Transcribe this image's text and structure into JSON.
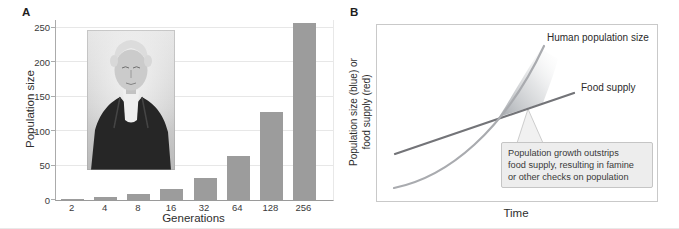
{
  "figure": {
    "panel_a_label": "A",
    "panel_b_label": "B",
    "portrait": "thomas-malthus-engraving"
  },
  "chart_data": [
    {
      "type": "bar",
      "panel": "A",
      "categories": [
        "2",
        "4",
        "8",
        "16",
        "32",
        "64",
        "128",
        "256"
      ],
      "values": [
        2,
        4,
        8,
        16,
        32,
        64,
        128,
        256
      ],
      "xlabel": "Generations",
      "ylabel": "Population size",
      "y_ticks": [
        0,
        50,
        100,
        150,
        200,
        250
      ],
      "ylim": [
        0,
        260
      ],
      "grid": true,
      "bar_color": "#9c9c9c"
    },
    {
      "type": "line",
      "panel": "B",
      "xlabel": "Time",
      "ylabel_lines": [
        "Population size (blue) or",
        "food supply (red)"
      ],
      "axis_ticks": "none",
      "series": [
        {
          "name": "Human population size",
          "shape": "exponential",
          "color": "#a9abaf",
          "x": [
            0,
            0.2,
            0.4,
            0.6,
            0.8,
            1
          ],
          "y": [
            0.07,
            0.12,
            0.2,
            0.34,
            0.58,
            0.95
          ]
        },
        {
          "name": "Food supply",
          "shape": "linear",
          "color": "#737478",
          "x": [
            0,
            1
          ],
          "y": [
            0.26,
            0.62
          ]
        }
      ],
      "intersection_note": "curves cross mid-plot; shaded wedge between curves after crossing",
      "annotation": "Population growth outstrips food supply, resulting in famine or other checks on population",
      "annotation_lines": [
        "Population growth outstrips",
        "food supply, resulting in famine",
        "or other checks on population"
      ]
    }
  ]
}
